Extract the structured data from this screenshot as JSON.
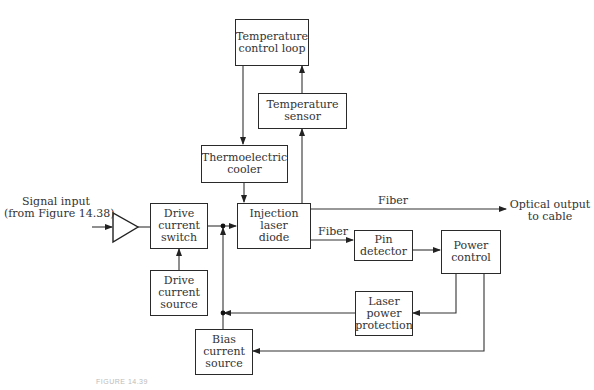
{
  "diagram": {
    "type": "block-diagram",
    "blocks": {
      "temp_control_loop": "Temperature control loop",
      "temp_sensor": "Temperature sensor",
      "thermoelectric_cooler": "Thermoelectric cooler",
      "injection_laser_diode": "Injection laser diode",
      "drive_current_switch": "Drive current switch",
      "drive_current_source": "Drive current source",
      "pin_detector": "Pin detector",
      "power_control": "Power control",
      "laser_power_protection": "Laser power protection",
      "bias_current_source": "Bias current source"
    },
    "labels": {
      "signal_input_line1": "Signal input",
      "signal_input_line2": "(from Figure 14.38)",
      "fiber_top": "Fiber",
      "fiber_bottom": "Fiber",
      "optical_output_line1": "Optical output",
      "optical_output_line2": "to cable"
    },
    "caption": "FIGURE 14.39",
    "edges": [
      {
        "from": "Signal input",
        "to": "Amplifier"
      },
      {
        "from": "Amplifier",
        "to": "Drive current switch"
      },
      {
        "from": "Drive current source",
        "to": "Drive current switch"
      },
      {
        "from": "Drive current switch",
        "to": "Injection laser diode"
      },
      {
        "from": "Temperature control loop",
        "to": "Thermoelectric cooler"
      },
      {
        "from": "Thermoelectric cooler",
        "to": "Injection laser diode"
      },
      {
        "from": "Injection laser diode",
        "to": "Temperature sensor"
      },
      {
        "from": "Temperature sensor",
        "to": "Temperature control loop"
      },
      {
        "from": "Injection laser diode",
        "to": "Optical output to cable",
        "label": "Fiber"
      },
      {
        "from": "Injection laser diode",
        "to": "Pin detector",
        "label": "Fiber"
      },
      {
        "from": "Pin detector",
        "to": "Power control"
      },
      {
        "from": "Power control",
        "to": "Laser power protection"
      },
      {
        "from": "Power control",
        "to": "Bias current source"
      },
      {
        "from": "Laser power protection",
        "to": "Bias line junction"
      },
      {
        "from": "Bias current source",
        "to": "Injection laser diode"
      }
    ]
  }
}
